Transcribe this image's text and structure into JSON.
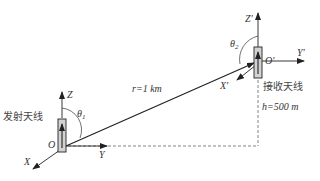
{
  "diagram": {
    "transmit_antenna": {
      "label": "发射天线",
      "origin": "O",
      "axes": {
        "x": "X",
        "y": "Y",
        "z": "Z"
      },
      "angle": "θ",
      "angle_sub": "1"
    },
    "receive_antenna": {
      "label": "接收天线",
      "origin": "O'",
      "axes": {
        "x": "X'",
        "y": "Y'",
        "z": "Z'"
      },
      "angle": "θ",
      "angle_sub": "2"
    },
    "distance_label": "r=1 km",
    "height_label": "h=500 m"
  },
  "colors": {
    "line": "#333333",
    "antenna_fill": "#cfcfcf",
    "dashed": "#555555"
  }
}
